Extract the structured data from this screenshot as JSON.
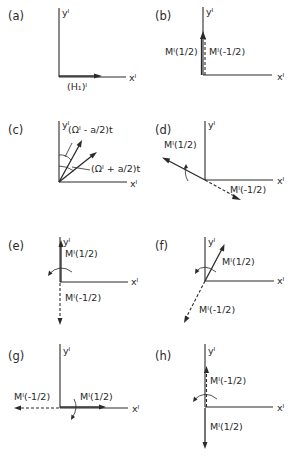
{
  "figure": {
    "axis_labels": {
      "x": "xᴵ",
      "y": "yᴵ"
    },
    "panels": [
      {
        "id": "a",
        "label": "(a)",
        "vectors": [
          {
            "label": "(H₁)ᴵ",
            "direction": "+x",
            "style": "solid"
          }
        ]
      },
      {
        "id": "b",
        "label": "(b)",
        "vectors": [
          {
            "label": "Mᴵ(1/2)",
            "direction": "+y",
            "style": "solid"
          },
          {
            "label": "Mᴵ(-1/2)",
            "direction": "+y",
            "style": "dashed"
          }
        ]
      },
      {
        "id": "c",
        "label": "(c)",
        "vectors": [
          {
            "label": "(Ωᴵ - a/2)t",
            "direction": "angle-steep",
            "style": "solid"
          },
          {
            "label": "(Ωᴵ + a/2)t",
            "direction": "angle-shallow",
            "style": "solid"
          }
        ]
      },
      {
        "id": "d",
        "label": "(d)",
        "vectors": [
          {
            "label": "Mᴵ(1/2)",
            "direction": "upper-left",
            "style": "solid"
          },
          {
            "label": "Mᴵ(-1/2)",
            "direction": "lower-right",
            "style": "dashed"
          }
        ]
      },
      {
        "id": "e",
        "label": "(e)",
        "vectors": [
          {
            "label": "Mᴵ(1/2)",
            "direction": "+y",
            "style": "solid"
          },
          {
            "label": "Mᴵ(-1/2)",
            "direction": "-y",
            "style": "dashed"
          }
        ]
      },
      {
        "id": "f",
        "label": "(f)",
        "vectors": [
          {
            "label": "Mᴵ(1/2)",
            "direction": "upper-right",
            "style": "solid"
          },
          {
            "label": "Mᴵ(-1/2)",
            "direction": "lower-left",
            "style": "dashed"
          }
        ]
      },
      {
        "id": "g",
        "label": "(g)",
        "vectors": [
          {
            "label": "Mᴵ(1/2)",
            "direction": "+x",
            "style": "solid"
          },
          {
            "label": "Mᴵ(-1/2)",
            "direction": "-x",
            "style": "dashed"
          }
        ]
      },
      {
        "id": "h",
        "label": "(h)",
        "vectors": [
          {
            "label": "Mᴵ(-1/2)",
            "direction": "+y",
            "style": "dashed"
          },
          {
            "label": "Mᴵ(1/2)",
            "direction": "-y",
            "style": "solid"
          }
        ]
      }
    ]
  }
}
